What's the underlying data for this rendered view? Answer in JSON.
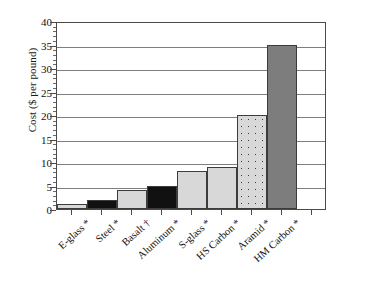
{
  "chart_data": {
    "type": "bar",
    "title": "",
    "xlabel": "",
    "ylabel": "Cost ($ per pound)",
    "ylim": [
      0,
      40
    ],
    "yticks": [
      0,
      5,
      10,
      15,
      20,
      25,
      30,
      35,
      40
    ],
    "ytick_labels": [
      "0",
      "5",
      "10",
      "15",
      "20",
      "25",
      "30",
      "35",
      "40"
    ],
    "grid": "horizontal",
    "legend": "none",
    "categories": [
      "E-glass *",
      "Steel *",
      "Basalt †",
      "Aluminum *",
      "S-glass *",
      "HS Carbon *",
      "Aramid *",
      "HM Carbon *"
    ],
    "values": [
      1,
      2,
      4,
      5,
      8,
      9,
      20,
      35
    ],
    "bar_fills": [
      "light-gray",
      "black",
      "light-gray",
      "black",
      "light-gray",
      "light-gray",
      "dotted-light-gray",
      "medium-gray"
    ],
    "colors": {
      "light-gray": "#d8d8d8",
      "black": "#111111",
      "medium-gray": "#7d7d7d",
      "dotted-light-gray": "#d8d8d8",
      "dot": "#3a3a3a",
      "axis": "#4a4a4a",
      "grid": "#7d7d7d",
      "background": "#ffffff"
    }
  }
}
